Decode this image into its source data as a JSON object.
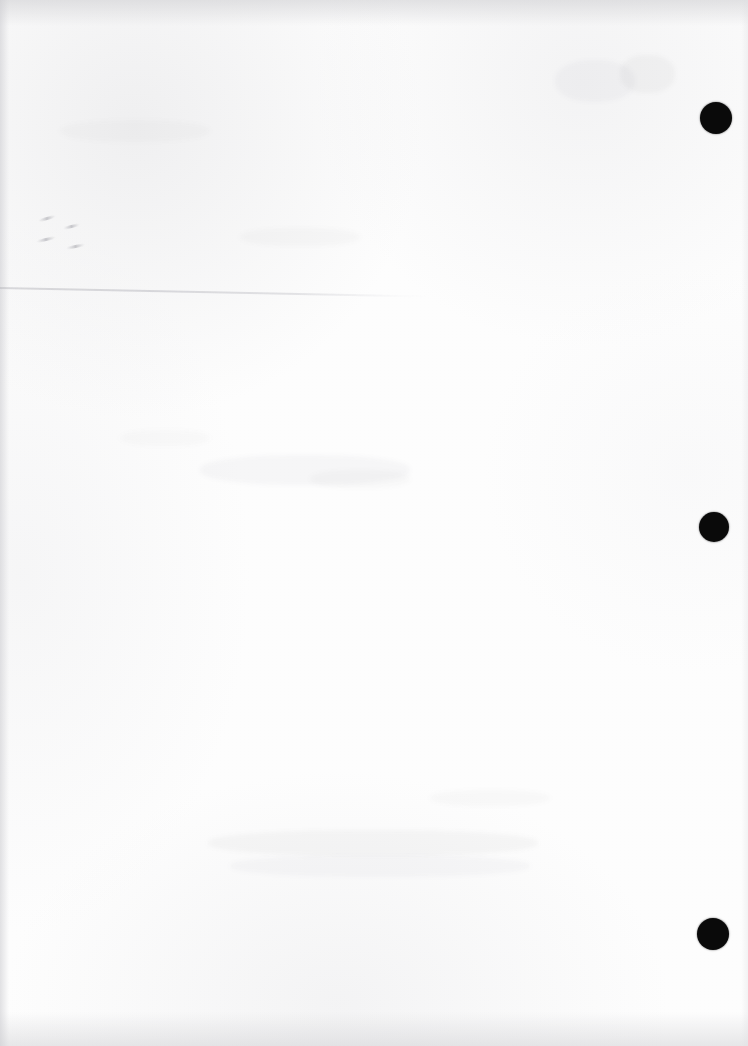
{
  "document": {
    "kind": "scanned-page",
    "title": "Scanned blank page",
    "page_width": 748,
    "page_height": 1046,
    "background_color": "#fdfdfd",
    "ink_color": "#0a0a0a",
    "content_text": "",
    "note": "Blank scanned sheet: no printed text, headings, tables or figures are visible."
  },
  "marks": {
    "punch_holes_label": "binder punch mark",
    "punch_holes": [
      {
        "name": "punch-mark-top",
        "cx": 716,
        "cy": 118,
        "r": 16
      },
      {
        "name": "punch-mark-middle",
        "cx": 714,
        "cy": 527,
        "r": 15
      },
      {
        "name": "punch-mark-bottom",
        "cx": 713,
        "cy": 934,
        "r": 16
      }
    ],
    "crease_label": "faint fold crease",
    "scuff_label": "pencil scuff mark",
    "scuffs": [
      {
        "left": 38,
        "top": 217,
        "width": 18,
        "height": 3,
        "rotate": -16
      },
      {
        "left": 63,
        "top": 225,
        "width": 17,
        "height": 3,
        "rotate": -14
      },
      {
        "left": 36,
        "top": 238,
        "width": 20,
        "height": 3,
        "rotate": -13
      },
      {
        "left": 66,
        "top": 245,
        "width": 19,
        "height": 3,
        "rotate": -12
      }
    ],
    "ghosts": [
      {
        "left": 200,
        "top": 455,
        "width": 210,
        "height": 30,
        "alpha": 0.035
      },
      {
        "left": 208,
        "top": 830,
        "width": 330,
        "height": 26,
        "alpha": 0.04
      },
      {
        "left": 230,
        "top": 855,
        "width": 300,
        "height": 22,
        "alpha": 0.032
      },
      {
        "left": 555,
        "top": 60,
        "width": 80,
        "height": 42,
        "alpha": 0.03
      },
      {
        "left": 620,
        "top": 55,
        "width": 55,
        "height": 38,
        "alpha": 0.038
      },
      {
        "left": 240,
        "top": 228,
        "width": 120,
        "height": 18,
        "alpha": 0.026
      },
      {
        "left": 310,
        "top": 470,
        "width": 100,
        "height": 18,
        "alpha": 0.028
      },
      {
        "left": 120,
        "top": 430,
        "width": 90,
        "height": 16,
        "alpha": 0.024
      },
      {
        "left": 430,
        "top": 790,
        "width": 120,
        "height": 16,
        "alpha": 0.026
      },
      {
        "left": 60,
        "top": 120,
        "width": 150,
        "height": 22,
        "alpha": 0.022
      }
    ]
  }
}
